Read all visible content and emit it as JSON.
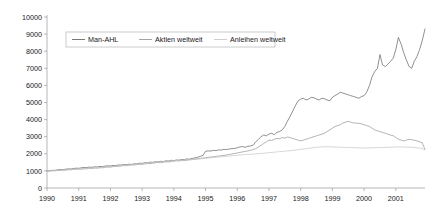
{
  "chart_data": {
    "type": "line",
    "title": "",
    "subtitle": "",
    "xlabel": "",
    "ylabel": "",
    "grid": false,
    "legend_position": "top-left",
    "ylim": [
      0,
      10000
    ],
    "xlim": [
      1990,
      2001.92
    ],
    "y_ticks": [
      0,
      1000,
      2000,
      3000,
      4000,
      5000,
      6000,
      7000,
      8000,
      9000,
      10000
    ],
    "y_tick_labels": [
      "0",
      "1000",
      "2000",
      "3000",
      "4000",
      "5000",
      "6000",
      "7000",
      "8000",
      "9000",
      "10000"
    ],
    "x_ticks": [
      1990,
      1991,
      1992,
      1993,
      1994,
      1995,
      1996,
      1997,
      1998,
      1999,
      2000,
      2001
    ],
    "x_tick_labels": [
      "1990",
      "1991",
      "1992",
      "1993",
      "1994",
      "1995",
      "1996",
      "1997",
      "1998",
      "1999",
      "2000",
      "2001"
    ],
    "x": [
      1990.0,
      1990.08,
      1990.17,
      1990.25,
      1990.33,
      1990.42,
      1990.5,
      1990.58,
      1990.67,
      1990.75,
      1990.83,
      1990.92,
      1991.0,
      1991.08,
      1991.17,
      1991.25,
      1991.33,
      1991.42,
      1991.5,
      1991.58,
      1991.67,
      1991.75,
      1991.83,
      1991.92,
      1992.0,
      1992.08,
      1992.17,
      1992.25,
      1992.33,
      1992.42,
      1992.5,
      1992.58,
      1992.67,
      1992.75,
      1992.83,
      1992.92,
      1993.0,
      1993.08,
      1993.17,
      1993.25,
      1993.33,
      1993.42,
      1993.5,
      1993.58,
      1993.67,
      1993.75,
      1993.83,
      1993.92,
      1994.0,
      1994.08,
      1994.17,
      1994.25,
      1994.33,
      1994.42,
      1994.5,
      1994.58,
      1994.67,
      1994.75,
      1994.83,
      1994.92,
      1995.0,
      1995.08,
      1995.17,
      1995.25,
      1995.33,
      1995.42,
      1995.5,
      1995.58,
      1995.67,
      1995.75,
      1995.83,
      1995.92,
      1996.0,
      1996.08,
      1996.17,
      1996.25,
      1996.33,
      1996.42,
      1996.5,
      1996.58,
      1996.67,
      1996.75,
      1996.83,
      1996.92,
      1997.0,
      1997.08,
      1997.17,
      1997.25,
      1997.33,
      1997.42,
      1997.5,
      1997.58,
      1997.67,
      1997.75,
      1997.83,
      1997.92,
      1998.0,
      1998.08,
      1998.17,
      1998.25,
      1998.33,
      1998.42,
      1998.5,
      1998.58,
      1998.67,
      1998.75,
      1998.83,
      1998.92,
      1999.0,
      1999.08,
      1999.17,
      1999.25,
      1999.33,
      1999.42,
      1999.5,
      1999.58,
      1999.67,
      1999.75,
      1999.83,
      1999.92,
      2000.0,
      2000.08,
      2000.17,
      2000.25,
      2000.33,
      2000.42,
      2000.5,
      2000.58,
      2000.67,
      2000.75,
      2000.83,
      2000.92,
      2001.0,
      2001.08,
      2001.17,
      2001.25,
      2001.33,
      2001.42,
      2001.5,
      2001.58,
      2001.67,
      2001.75,
      2001.83,
      2001.92
    ],
    "series": [
      {
        "name": "Man-AHL",
        "color": "#6b6b6b",
        "values": [
          1000,
          1010,
          1040,
          1030,
          1060,
          1080,
          1070,
          1100,
          1120,
          1110,
          1140,
          1160,
          1150,
          1180,
          1200,
          1190,
          1220,
          1210,
          1240,
          1230,
          1260,
          1250,
          1280,
          1300,
          1290,
          1320,
          1310,
          1350,
          1340,
          1370,
          1360,
          1390,
          1380,
          1420,
          1410,
          1450,
          1440,
          1480,
          1470,
          1510,
          1500,
          1540,
          1520,
          1560,
          1550,
          1590,
          1580,
          1620,
          1600,
          1640,
          1630,
          1670,
          1660,
          1700,
          1690,
          1730,
          1760,
          1800,
          1850,
          1900,
          2150,
          2170,
          2160,
          2200,
          2190,
          2230,
          2220,
          2260,
          2250,
          2280,
          2300,
          2320,
          2350,
          2400,
          2420,
          2380,
          2440,
          2460,
          2500,
          2700,
          2850,
          3000,
          3100,
          3050,
          3150,
          3200,
          3120,
          3250,
          3300,
          3400,
          3600,
          3900,
          4200,
          4500,
          4800,
          5100,
          5200,
          5250,
          5150,
          5200,
          5300,
          5280,
          5200,
          5150,
          5250,
          5220,
          5150,
          5100,
          5300,
          5400,
          5500,
          5600,
          5550,
          5500,
          5450,
          5400,
          5350,
          5300,
          5250,
          5350,
          5400,
          5600,
          6000,
          6500,
          6800,
          7000,
          7800,
          7200,
          7100,
          7250,
          7400,
          7600,
          8100,
          8800,
          8400,
          7900,
          7500,
          7100,
          7000,
          7400,
          7700,
          8100,
          8600,
          9300
        ]
      },
      {
        "name": "Aktien weltweit",
        "color": "#9a9a9a",
        "values": [
          1000,
          990,
          1010,
          1000,
          1030,
          1020,
          1050,
          1040,
          1070,
          1060,
          1090,
          1080,
          1110,
          1100,
          1130,
          1120,
          1150,
          1140,
          1170,
          1160,
          1190,
          1180,
          1210,
          1230,
          1220,
          1250,
          1270,
          1260,
          1290,
          1310,
          1300,
          1330,
          1350,
          1340,
          1370,
          1390,
          1380,
          1410,
          1430,
          1420,
          1450,
          1470,
          1490,
          1480,
          1510,
          1530,
          1520,
          1550,
          1570,
          1590,
          1580,
          1610,
          1600,
          1630,
          1650,
          1670,
          1690,
          1710,
          1730,
          1750,
          1770,
          1790,
          1810,
          1830,
          1850,
          1870,
          1890,
          1910,
          1930,
          1960,
          1990,
          2020,
          2050,
          2080,
          2110,
          2140,
          2170,
          2200,
          2250,
          2300,
          2400,
          2500,
          2600,
          2700,
          2800,
          2780,
          2850,
          2900,
          2880,
          2950,
          2920,
          2980,
          2950,
          2900,
          2850,
          2800,
          2750,
          2800,
          2850,
          2900,
          2950,
          3000,
          3050,
          3100,
          3150,
          3200,
          3300,
          3400,
          3500,
          3600,
          3650,
          3700,
          3800,
          3850,
          3900,
          3850,
          3800,
          3800,
          3780,
          3750,
          3700,
          3650,
          3600,
          3500,
          3400,
          3350,
          3300,
          3250,
          3200,
          3150,
          3100,
          3050,
          2950,
          2850,
          2800,
          2750,
          2800,
          2850,
          2820,
          2800,
          2750,
          2700,
          2650,
          2250
        ]
      },
      {
        "name": "Anleihen weltweit",
        "color": "#c8c8c8",
        "values": [
          1000,
          1005,
          1015,
          1020,
          1030,
          1040,
          1050,
          1060,
          1070,
          1080,
          1090,
          1100,
          1110,
          1120,
          1130,
          1140,
          1150,
          1160,
          1170,
          1180,
          1190,
          1200,
          1215,
          1230,
          1245,
          1260,
          1270,
          1285,
          1300,
          1315,
          1330,
          1345,
          1360,
          1375,
          1390,
          1405,
          1420,
          1435,
          1450,
          1465,
          1480,
          1495,
          1510,
          1525,
          1540,
          1555,
          1570,
          1585,
          1595,
          1605,
          1615,
          1625,
          1635,
          1645,
          1655,
          1665,
          1675,
          1690,
          1705,
          1720,
          1735,
          1750,
          1765,
          1780,
          1795,
          1810,
          1825,
          1840,
          1855,
          1870,
          1885,
          1900,
          1915,
          1930,
          1945,
          1955,
          1965,
          1975,
          1985,
          1995,
          2005,
          2020,
          2035,
          2050,
          2065,
          2080,
          2095,
          2110,
          2125,
          2140,
          2155,
          2170,
          2185,
          2200,
          2220,
          2240,
          2260,
          2280,
          2300,
          2320,
          2340,
          2360,
          2380,
          2395,
          2405,
          2410,
          2415,
          2410,
          2400,
          2395,
          2390,
          2385,
          2380,
          2375,
          2370,
          2365,
          2360,
          2355,
          2350,
          2345,
          2340,
          2340,
          2345,
          2350,
          2355,
          2360,
          2365,
          2370,
          2375,
          2380,
          2385,
          2390,
          2395,
          2400,
          2400,
          2395,
          2390,
          2385,
          2380,
          2370,
          2350,
          2330,
          2300,
          2250
        ]
      }
    ]
  },
  "legend": {
    "entries": [
      {
        "label": "Man-AHL",
        "color": "#6b6b6b"
      },
      {
        "label": "Aktien weltweit",
        "color": "#9a9a9a"
      },
      {
        "label": "Anleihen weltweit",
        "color": "#c8c8c8"
      }
    ]
  },
  "axis_colors": {
    "axis_line": "#9a9a9a",
    "tick_text": "#1a1a1a"
  }
}
